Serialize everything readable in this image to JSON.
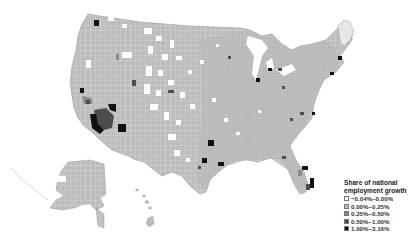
{
  "map": {
    "type": "choropleth",
    "region": "United States counties",
    "legend": {
      "title_line1": "Share of national",
      "title_line2": "employment growth",
      "items": [
        {
          "label": "−0.04%–0.00%",
          "color": "#ffffff"
        },
        {
          "label": "0.00%–0.25%",
          "color": "#bdbdbd"
        },
        {
          "label": "0.25%–0.50%",
          "color": "#8a8a8a"
        },
        {
          "label": "0.50%–1.00%",
          "color": "#4d4d4d"
        },
        {
          "label": "1.00%–3.16%",
          "color": "#111111"
        }
      ]
    },
    "colors": {
      "background": "#ffffff",
      "county_fill": "#bdbdbd",
      "county_border": "#ffffff"
    }
  }
}
